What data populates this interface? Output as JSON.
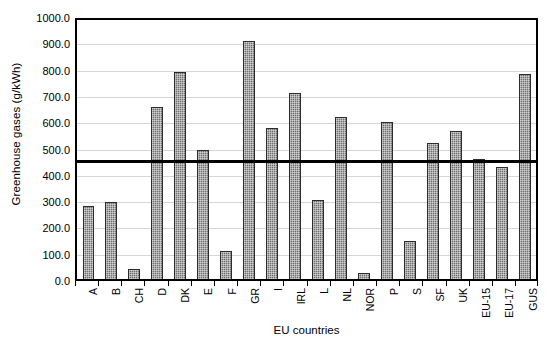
{
  "chart_data": {
    "type": "bar",
    "title": "",
    "xlabel": "EU countries",
    "ylabel": "Greenhouse gases (g/kWh)",
    "categories": [
      "A",
      "B",
      "CH",
      "D",
      "DK",
      "E",
      "F",
      "GR",
      "I",
      "IRL",
      "L",
      "NL",
      "NOR",
      "P",
      "S",
      "SF",
      "UK",
      "EU-15",
      "EU-17",
      "GUS"
    ],
    "values": [
      283,
      297,
      40,
      663,
      800,
      500,
      110,
      920,
      585,
      720,
      305,
      625,
      22,
      608,
      148,
      525,
      573,
      465,
      432,
      792
    ],
    "series": [
      {
        "name": "Greenhouse gases",
        "values": [
          283,
          297,
          40,
          663,
          800,
          500,
          110,
          920,
          585,
          720,
          305,
          625,
          22,
          608,
          148,
          525,
          573,
          465,
          432,
          792
        ]
      }
    ],
    "ylim": [
      0,
      1000
    ],
    "ytick_values": [
      0,
      100,
      200,
      300,
      400,
      500,
      600,
      700,
      800,
      900,
      1000
    ],
    "ytick_labels": [
      "0.0",
      "100.0",
      "200.0",
      "300.0",
      "400.0",
      "500.0",
      "600.0",
      "700.0",
      "800.0",
      "900.0",
      "1000.0"
    ],
    "grid": true,
    "legend": "none",
    "annotations": [
      {
        "name": "reference-line",
        "type": "horizontal-line",
        "value": 457,
        "style": "thick-black-solid"
      }
    ],
    "bar_color": "#6e6e6e",
    "bar_edge_color": "#2b2b2b",
    "gridline_color": "#d6d6d6",
    "axis_color": "#000000",
    "background_color": "#ffffff"
  }
}
